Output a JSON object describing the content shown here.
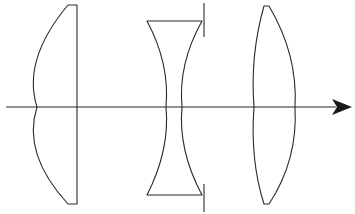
{
  "diagram": {
    "type": "optical-layout",
    "colors": {
      "line": "#2a2a2a",
      "background": "#ffffff"
    },
    "optical_axis": {
      "y": 107,
      "x_start": 6,
      "x_end": 333,
      "direction": "left-to-right",
      "arrowhead": true
    },
    "elements": [
      {
        "id": "lens-1",
        "kind": "plano-convex",
        "front_apex_x": 37,
        "back_x": 77,
        "top_y": 5,
        "bottom_y": 204
      },
      {
        "id": "lens-2",
        "kind": "biconcave",
        "left_center_x": 166,
        "right_center_x": 182,
        "top_y": 21,
        "bottom_y": 195,
        "left_edge_x": 147,
        "right_edge_x": 202
      },
      {
        "id": "aperture-stop",
        "kind": "stop",
        "x": 204,
        "upper": [
          3,
          37
        ],
        "lower": [
          184,
          212
        ]
      },
      {
        "id": "lens-3",
        "kind": "biconvex",
        "left_apex_x": 254,
        "right_apex_x": 295,
        "top_y": 6,
        "bottom_y": 204
      }
    ]
  }
}
